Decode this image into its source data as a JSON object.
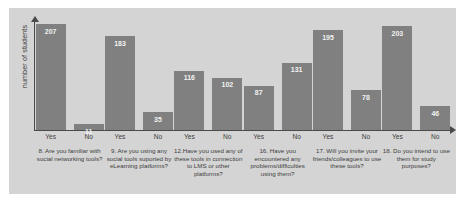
{
  "chart_data": {
    "type": "bar",
    "title": "",
    "subtitle": "",
    "xlabel": "",
    "ylabel": "number of students",
    "ylim": [
      0,
      215
    ],
    "grid": false,
    "legend": null,
    "categories": [
      "Yes",
      "No"
    ],
    "groups": [
      {
        "question": "8. Are you familiar with social networking tools?",
        "bars": [
          {
            "category": "Yes",
            "value": 207
          },
          {
            "category": "No",
            "value": 11
          }
        ]
      },
      {
        "question": "9. Are you using any social tools suported by eLearning platforms?",
        "bars": [
          {
            "category": "Yes",
            "value": 183
          },
          {
            "category": "No",
            "value": 35
          }
        ]
      },
      {
        "question": "12.Have you used any of these tools in connection to LMS or other platforms?",
        "bars": [
          {
            "category": "Yes",
            "value": 116
          },
          {
            "category": "No",
            "value": 102
          }
        ]
      },
      {
        "question": "16. Have you encountered any problems/difficulties using them?",
        "bars": [
          {
            "category": "Yes",
            "value": 87
          },
          {
            "category": "No",
            "value": 131
          }
        ]
      },
      {
        "question": "17. Will you invite your friends/colleagues to use these tools?",
        "bars": [
          {
            "category": "Yes",
            "value": 195
          },
          {
            "category": "No",
            "value": 78
          }
        ]
      },
      {
        "question": "18. Do you intend to use them for study purposes?",
        "bars": [
          {
            "category": "Yes",
            "value": 203
          },
          {
            "category": "No",
            "value": 46
          }
        ]
      }
    ],
    "colors": {
      "bar": "#808080",
      "plot_background": "#d4d4d4",
      "axis": "#4a4a4a",
      "value_label": "#f2f2f2",
      "tick_label": "#3d3d3d"
    }
  }
}
